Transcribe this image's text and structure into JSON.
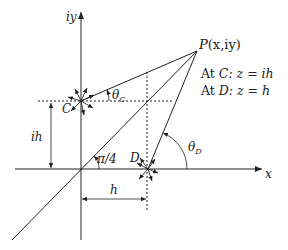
{
  "figure": {
    "axes": {
      "x_label": "x",
      "y_label": "iy"
    },
    "points": {
      "P": {
        "label": "P(x,iy)",
        "name": "P",
        "coords": "(x,iy)"
      },
      "C": {
        "label": "C"
      },
      "D": {
        "label": "D"
      }
    },
    "annotations": {
      "at_c_prefix": "At ",
      "at_c_point": "C",
      "at_c_eq": ": z = ih",
      "at_d_prefix": "At ",
      "at_d_point": "D",
      "at_d_eq": ": z = h"
    },
    "angles": {
      "theta_c": {
        "symbol": "θ",
        "sub": "C"
      },
      "theta_d": {
        "symbol": "θ",
        "sub": "D"
      },
      "diagonal": "π/4"
    },
    "dimensions": {
      "vertical": "ih",
      "horizontal": "h"
    },
    "colors": {
      "line": "#222222",
      "background": "#ffffff"
    }
  }
}
